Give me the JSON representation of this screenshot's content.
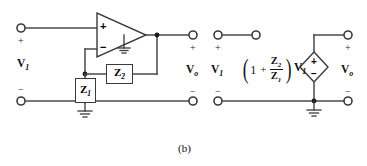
{
  "figure": {
    "caption": "(b)"
  },
  "left_circuit": {
    "name": "op-amp-circuit",
    "input_label": "V",
    "input_sub": "1",
    "output_label": "V",
    "output_sub": "o",
    "plus_sign": "+",
    "minus_sign": "−",
    "opamp": {
      "noninverting_sign": "+",
      "inverting_sign": "−",
      "ground_name": "opamp-ground"
    },
    "impedance_feedback": {
      "label": "Z",
      "sub": "2"
    },
    "impedance_input": {
      "label": "Z",
      "sub": "1"
    }
  },
  "right_circuit": {
    "name": "equivalent-source-circuit",
    "input_label": "V",
    "input_sub": "1",
    "output_label": "V",
    "output_sub": "o",
    "plus_sign": "+",
    "minus_sign": "−",
    "equation": {
      "one": "1",
      "plus": "+",
      "numerator": "Z",
      "numerator_sub": "2",
      "denominator": "Z",
      "denominator_sub": "1",
      "multiplier": "V",
      "multiplier_sub": "1",
      "open_paren": "(",
      "close_paren": ")",
      "full_text": "(1 + Z2/Z1)V1"
    },
    "dependent_source": {
      "plus_sign": "+",
      "minus_sign": "−",
      "shape": "diamond"
    }
  },
  "colors": {
    "wire": "#4a4a4a",
    "ink": "#111111",
    "box_border": "#3a3a3a",
    "background": "#ffffff"
  }
}
